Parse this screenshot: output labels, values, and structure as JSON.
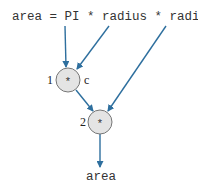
{
  "code": {
    "statement": "area = PI * radius * radius;"
  },
  "nodes": [
    {
      "id": 1,
      "number": "1",
      "operator": "*",
      "tag": "c"
    },
    {
      "id": 2,
      "number": "2",
      "operator": "*",
      "tag": ""
    }
  ],
  "output": {
    "label": "area"
  },
  "colors": {
    "arrow": "#2e6f9e",
    "node_fill": "#e4e4e4",
    "node_stroke": "#777777",
    "text": "#333333"
  }
}
